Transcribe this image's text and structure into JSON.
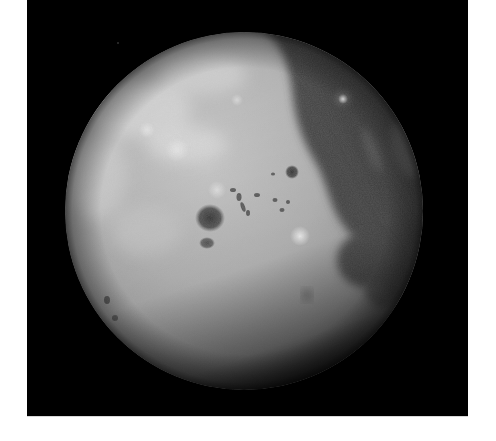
{
  "image": {
    "subject": "Moon",
    "alt": "Full-disk photograph of the Moon against black space",
    "background_color": "#000000",
    "page_color": "#ffffff",
    "colors": {
      "highlands": "#bdbdbd",
      "highlands_bright": "#d2d2d2",
      "maria_dark": "#3c3c3c",
      "maria_mid": "#555555",
      "limb_shadow": "#1a1a1a"
    }
  }
}
